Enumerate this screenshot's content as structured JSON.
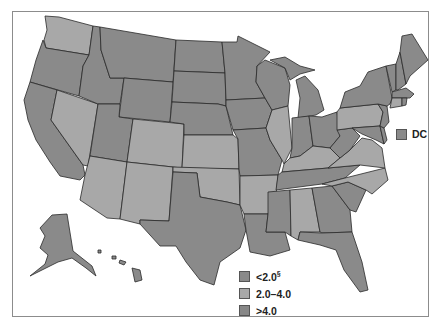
{
  "map": {
    "type": "choropleth",
    "region": "United States",
    "colors": {
      "low": "#8a8a8a",
      "mid": "#a8a8a8",
      "high": "#878787",
      "border": "#2a2a2a",
      "frame": "#8c8c8c"
    }
  },
  "legend": {
    "items": [
      {
        "label": "<2.0",
        "superscript": "§",
        "category": "low"
      },
      {
        "label": "2.0–4.0",
        "superscript": "",
        "category": "mid"
      },
      {
        "label": ">4.0",
        "superscript": "",
        "category": "high"
      }
    ]
  },
  "dc": {
    "label": "DC",
    "category": "dark"
  },
  "states": {
    "light": [
      "WA",
      "NV",
      "AZ",
      "CO",
      "NM",
      "KS",
      "OK",
      "AR",
      "IL",
      "KY",
      "PA",
      "VA",
      "NC",
      "AL",
      "CT"
    ],
    "dark": [
      "OR",
      "CA",
      "ID",
      "MT",
      "WY",
      "UT",
      "ND",
      "SD",
      "NE",
      "TX",
      "MN",
      "IA",
      "MO",
      "LA",
      "WI",
      "MI",
      "IN",
      "OH",
      "TN",
      "MS",
      "GA",
      "FL",
      "SC",
      "WV",
      "MD",
      "DE",
      "NJ",
      "NY",
      "VT",
      "NH",
      "ME",
      "MA",
      "RI",
      "AK",
      "HI"
    ]
  }
}
